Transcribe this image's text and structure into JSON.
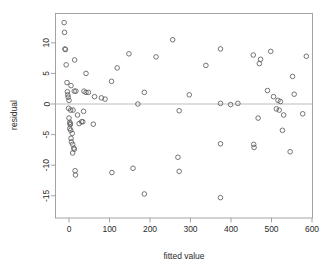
{
  "chart_data": {
    "type": "scatter",
    "title": "",
    "xlabel": "fitted value",
    "ylabel": "residual",
    "xlim": [
      -30,
      612
    ],
    "ylim": [
      -17.5,
      14.5
    ],
    "grid": false,
    "legend": null,
    "xticks": [
      0,
      100,
      200,
      300,
      400,
      500,
      600
    ],
    "xtick_labels": [
      "0",
      "100",
      "200",
      "300",
      "400",
      "500",
      "600"
    ],
    "yticks": [
      10,
      5,
      0,
      -5,
      -10,
      -15
    ],
    "ytick_labels": [
      "10",
      "5",
      "0",
      "-5",
      "-10",
      "-15"
    ],
    "annotations": [
      {
        "kind": "hline",
        "y": 0,
        "label": "zero residual reference line"
      }
    ],
    "marker": "open-circle",
    "point_color": "#5d5d5d",
    "points": [
      {
        "x": -12,
        "y": 13.3
      },
      {
        "x": -11,
        "y": 11.7
      },
      {
        "x": -10,
        "y": 9.0
      },
      {
        "x": -9,
        "y": 8.9
      },
      {
        "x": -7,
        "y": 6.4
      },
      {
        "x": 14,
        "y": 7.2
      },
      {
        "x": 42,
        "y": 5.0
      },
      {
        "x": 148,
        "y": 8.2
      },
      {
        "x": 119,
        "y": 5.9
      },
      {
        "x": 105,
        "y": 3.7
      },
      {
        "x": 215,
        "y": 7.7
      },
      {
        "x": 256,
        "y": 10.5
      },
      {
        "x": 338,
        "y": 6.3
      },
      {
        "x": 374,
        "y": 9.0
      },
      {
        "x": 455,
        "y": 8.0
      },
      {
        "x": 470,
        "y": 6.6
      },
      {
        "x": 473,
        "y": 7.3
      },
      {
        "x": 498,
        "y": 8.6
      },
      {
        "x": 586,
        "y": 7.8
      },
      {
        "x": 552,
        "y": 4.5
      },
      {
        "x": -5,
        "y": 3.5
      },
      {
        "x": 5,
        "y": 3.0
      },
      {
        "x": -4,
        "y": 2.0
      },
      {
        "x": -3,
        "y": 1.5
      },
      {
        "x": -2,
        "y": 1.1
      },
      {
        "x": 13,
        "y": 2.1
      },
      {
        "x": 17,
        "y": 2.1
      },
      {
        "x": 37,
        "y": 2.1
      },
      {
        "x": 42,
        "y": 1.9
      },
      {
        "x": 48,
        "y": 1.9
      },
      {
        "x": 63,
        "y": 1.2
      },
      {
        "x": 80,
        "y": 1.0
      },
      {
        "x": 89,
        "y": 0.8
      },
      {
        "x": 0,
        "y": 0.6
      },
      {
        "x": 186,
        "y": 1.9
      },
      {
        "x": 297,
        "y": 1.5
      },
      {
        "x": 490,
        "y": 2.2
      },
      {
        "x": 505,
        "y": 1.2
      },
      {
        "x": 516,
        "y": 0.6
      },
      {
        "x": 522,
        "y": 0.4
      },
      {
        "x": 556,
        "y": 1.6
      },
      {
        "x": 170,
        "y": 0.0
      },
      {
        "x": 374,
        "y": 0.1
      },
      {
        "x": 399,
        "y": -0.1
      },
      {
        "x": 417,
        "y": 0.1
      },
      {
        "x": -1,
        "y": -0.7
      },
      {
        "x": 4,
        "y": -1.0
      },
      {
        "x": 10,
        "y": -1.0
      },
      {
        "x": 21,
        "y": -1.8
      },
      {
        "x": 36,
        "y": -1.2
      },
      {
        "x": 272,
        "y": -1.1
      },
      {
        "x": 512,
        "y": -0.8
      },
      {
        "x": 519,
        "y": -1.0
      },
      {
        "x": 530,
        "y": -1.8
      },
      {
        "x": 577,
        "y": -1.6
      },
      {
        "x": 0,
        "y": -2.3
      },
      {
        "x": 2,
        "y": -3.0
      },
      {
        "x": 3,
        "y": -3.2
      },
      {
        "x": 3,
        "y": -3.4
      },
      {
        "x": 25,
        "y": -3.2
      },
      {
        "x": 31,
        "y": -2.9
      },
      {
        "x": 34,
        "y": -2.9
      },
      {
        "x": 60,
        "y": -3.3
      },
      {
        "x": 467,
        "y": -2.3
      },
      {
        "x": 2,
        "y": -4.0
      },
      {
        "x": 4,
        "y": -4.3
      },
      {
        "x": 8,
        "y": -4.8
      },
      {
        "x": 527,
        "y": -4.3
      },
      {
        "x": 5,
        "y": -5.6
      },
      {
        "x": 6,
        "y": -6.2
      },
      {
        "x": 9,
        "y": -6.6
      },
      {
        "x": 12,
        "y": -7.2
      },
      {
        "x": 13,
        "y": -7.4
      },
      {
        "x": 9,
        "y": -8.0
      },
      {
        "x": 374,
        "y": -6.5
      },
      {
        "x": 456,
        "y": -6.6
      },
      {
        "x": 457,
        "y": -7.1
      },
      {
        "x": 546,
        "y": -7.8
      },
      {
        "x": 269,
        "y": -8.7
      },
      {
        "x": 15,
        "y": -10.9
      },
      {
        "x": 16,
        "y": -11.6
      },
      {
        "x": 106,
        "y": -11.2
      },
      {
        "x": 158,
        "y": -10.5
      },
      {
        "x": 272,
        "y": -11.0
      },
      {
        "x": 186,
        "y": -14.7
      },
      {
        "x": 374,
        "y": -15.3
      }
    ]
  },
  "axes": {
    "x_axis_title": "fitted value",
    "y_axis_title": "residual"
  }
}
